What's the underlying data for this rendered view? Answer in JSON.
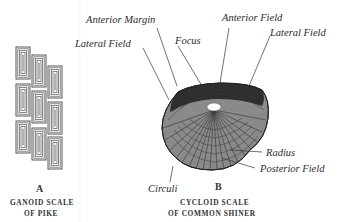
{
  "figure_a": {
    "letter": "A",
    "caption_line1": "GANOID SCALE",
    "caption_line2": "OF PIKE"
  },
  "figure_b": {
    "letter": "B",
    "caption_line1": "CYCLOID SCALE",
    "caption_line2": "OF COMMON SHINER",
    "labels": {
      "anterior_margin": "Anterior Margin",
      "lateral_field_left": "Lateral Field",
      "focus": "Focus",
      "anterior_field": "Anterior Field",
      "lateral_field_right": "Lateral Field",
      "circuli": "Circuli",
      "radius": "Radius",
      "posterior_field": "Posterior Field"
    }
  },
  "colors": {
    "ink": "#2a2a2a",
    "background": "#ffffff"
  }
}
